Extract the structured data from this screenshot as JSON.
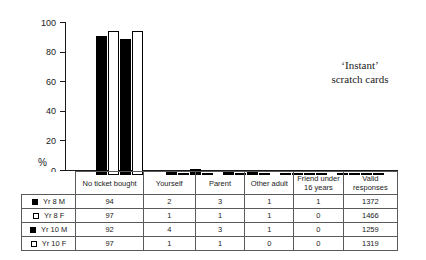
{
  "caption": {
    "line1": "‘Instant’",
    "line2": "scratch cards"
  },
  "axis": {
    "y_title": "%",
    "y_ticks": [
      "0",
      "20",
      "40",
      "60",
      "80",
      "100"
    ]
  },
  "table": {
    "corner_label": "",
    "headers": [
      "No ticket bought",
      "Yourself",
      "Parent",
      "Other adult",
      "Friend under 16 years",
      "Valid responses"
    ],
    "rows": [
      {
        "label": "Yr 8 M",
        "swatch": "solid",
        "values": [
          "94",
          "2",
          "3",
          "1",
          "1",
          "1372"
        ]
      },
      {
        "label": "Yr 8 F",
        "swatch": "hollow",
        "values": [
          "97",
          "1",
          "1",
          "1",
          "0",
          "1466"
        ]
      },
      {
        "label": "Yr 10 M",
        "swatch": "solid",
        "values": [
          "92",
          "4",
          "3",
          "1",
          "0",
          "1259"
        ]
      },
      {
        "label": "Yr 10 F",
        "swatch": "hollow",
        "values": [
          "97",
          "1",
          "1",
          "0",
          "0",
          "1319"
        ]
      }
    ]
  },
  "chart_data": {
    "type": "bar",
    "title": "‘Instant’ scratch cards",
    "xlabel": "",
    "ylabel": "%",
    "ylim": [
      0,
      100
    ],
    "yticks": [
      0,
      20,
      40,
      60,
      80,
      100
    ],
    "grid": false,
    "legend_position": "table-left",
    "categories": [
      "No ticket bought",
      "Yourself",
      "Parent",
      "Other adult",
      "Friend under 16 years"
    ],
    "series": [
      {
        "name": "Yr 8 M",
        "fill": "solid",
        "values": [
          94,
          2,
          3,
          1,
          1
        ],
        "valid_responses": 1372
      },
      {
        "name": "Yr 8 F",
        "fill": "hollow",
        "values": [
          97,
          1,
          1,
          1,
          0
        ],
        "valid_responses": 1466
      },
      {
        "name": "Yr 10 M",
        "fill": "solid",
        "values": [
          92,
          4,
          3,
          1,
          0
        ],
        "valid_responses": 1259
      },
      {
        "name": "Yr 10 F",
        "fill": "hollow",
        "values": [
          97,
          1,
          1,
          0,
          0
        ],
        "valid_responses": 1319
      }
    ]
  }
}
